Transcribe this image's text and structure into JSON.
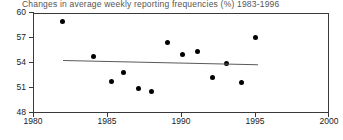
{
  "chart_data": {
    "type": "scatter",
    "title": "Changes in average weekly reporting frequencies (%) 1983-1996",
    "xlabel": "",
    "ylabel": "",
    "xlim": [
      1980,
      2000
    ],
    "ylim": [
      48,
      60
    ],
    "xticks": [
      1980,
      1985,
      1990,
      1995,
      2000
    ],
    "yticks": [
      48,
      51,
      54,
      57,
      60
    ],
    "grid": false,
    "legend": null,
    "series": [
      {
        "name": "Average weekly reporting frequency",
        "marker": "filled-circle",
        "color": "#000000",
        "points": [
          {
            "x": 1982.0,
            "y": 58.9
          },
          {
            "x": 1984.1,
            "y": 54.7
          },
          {
            "x": 1985.3,
            "y": 51.7
          },
          {
            "x": 1986.1,
            "y": 52.7
          },
          {
            "x": 1987.1,
            "y": 50.8
          },
          {
            "x": 1988.0,
            "y": 50.5
          },
          {
            "x": 1989.1,
            "y": 56.4
          },
          {
            "x": 1990.1,
            "y": 54.9
          },
          {
            "x": 1991.1,
            "y": 55.3
          },
          {
            "x": 1992.1,
            "y": 52.2
          },
          {
            "x": 1993.1,
            "y": 53.8
          },
          {
            "x": 1994.1,
            "y": 51.5
          },
          {
            "x": 1995.0,
            "y": 56.9
          }
        ]
      }
    ],
    "trendline": {
      "name": "linear fit",
      "color": "#5a5a5a",
      "x0": 1982.0,
      "y0": 54.2,
      "x1": 1995.2,
      "y1": 53.7
    }
  },
  "axes": {
    "y_tick_labels": [
      "60",
      "57",
      "54",
      "51",
      "48"
    ],
    "x_tick_labels": [
      "1980",
      "1985",
      "1990",
      "1995",
      "2000"
    ]
  }
}
